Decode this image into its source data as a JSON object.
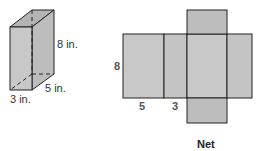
{
  "prism": {
    "labels": {
      "height": "8 in.",
      "depth": "5 in.",
      "width": "3 in."
    }
  },
  "net": {
    "labels": {
      "height": "8",
      "width_a": "5",
      "width_b": "3"
    },
    "caption": "Net"
  },
  "colors": {
    "face": "#c8c8c8",
    "face_dark": "#bdbdbd",
    "top_face": "#b4b4b4",
    "stroke": "#222222"
  }
}
